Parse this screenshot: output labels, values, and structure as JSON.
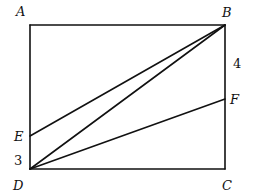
{
  "diagram": {
    "type": "geometry-rectangle",
    "points": {
      "A": {
        "label": "A",
        "x": 30,
        "y": 25
      },
      "B": {
        "label": "B",
        "x": 225,
        "y": 25
      },
      "C": {
        "label": "C",
        "x": 225,
        "y": 169
      },
      "D": {
        "label": "D",
        "x": 30,
        "y": 169
      },
      "E": {
        "label": "E",
        "x": 30,
        "y": 136
      },
      "F": {
        "label": "F",
        "x": 225,
        "y": 99
      }
    },
    "segments": [
      "AB",
      "BC",
      "CD",
      "DA",
      "EB",
      "DB",
      "DF"
    ],
    "measurements": {
      "ED": "3",
      "BF": "4"
    },
    "labels": {
      "A": "A",
      "B": "B",
      "C": "C",
      "D": "D",
      "E": "E",
      "F": "F",
      "ed_length": "3",
      "bf_length": "4"
    }
  }
}
